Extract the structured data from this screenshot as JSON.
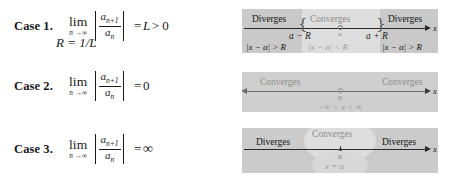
{
  "colors": {
    "ink": "#1a1a1a",
    "axis": "#2a2a2a",
    "band_outer": "#c9c9c9",
    "band_inner": "#dedede",
    "muted_text": "#8d8d8d",
    "dark_text": "#151515"
  },
  "cases": [
    {
      "label": "Case 1.",
      "limit_word": "lim",
      "limit_sub": "n →∞",
      "numerator": "a",
      "numerator_sub": "n+1",
      "denominator": "a",
      "denominator_sub": "n",
      "equals": "=",
      "result": "L",
      "relation": "> 0",
      "second_line": "R = 1/L"
    },
    {
      "label": "Case 2.",
      "limit_word": "lim",
      "limit_sub": "n →∞",
      "numerator": "a",
      "numerator_sub": "n+1",
      "denominator": "a",
      "denominator_sub": "n",
      "equals": "=",
      "result": "0",
      "relation": "",
      "second_line": ""
    },
    {
      "label": "Case 3.",
      "limit_word": "lim",
      "limit_sub": "n →∞",
      "numerator": "a",
      "numerator_sub": "n+1",
      "denominator": "a",
      "denominator_sub": "n",
      "equals": "=",
      "result": "∞",
      "relation": "",
      "second_line": ""
    }
  ],
  "diagrams": [
    {
      "id": "case1-number-line",
      "axis_label": "x",
      "left_region_word": "Diverges",
      "middle_region_word": "Converges",
      "right_region_word": "Diverges",
      "left_endpoint_label": "a − R",
      "center_label": "a",
      "right_endpoint_label": "a + R",
      "left_condition": "|x − a| > R",
      "middle_condition": "|x − a| < R",
      "right_condition": "|x − a| > R"
    },
    {
      "id": "case2-number-line",
      "axis_label": "x",
      "left_region_word": "Converges",
      "right_region_word": "Converges",
      "center_label": "a",
      "interval_condition": "−∞ < x < ∞"
    },
    {
      "id": "case3-number-line",
      "axis_label": "x",
      "left_region_word": "Diverges",
      "middle_region_word": "Converges",
      "right_region_word": "Diverges",
      "center_label": "a",
      "point_condition": "x = a"
    }
  ]
}
